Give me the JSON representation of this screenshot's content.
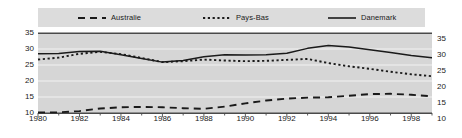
{
  "chart_data": {
    "type": "line",
    "title": "",
    "subtitle": "",
    "xlabel": "",
    "ylabel": "",
    "xlim": [
      1980,
      1999
    ],
    "ylim": [
      10,
      35
    ],
    "grid": true,
    "legend_position": "top",
    "x": [
      1980,
      1981,
      1982,
      1983,
      1984,
      1985,
      1986,
      1987,
      1988,
      1989,
      1990,
      1991,
      1992,
      1993,
      1994,
      1995,
      1996,
      1997,
      1998,
      1999
    ],
    "series": [
      {
        "name": "Australie",
        "style": "dashed",
        "color": "#1a1a1a",
        "values": [
          10.2,
          10.2,
          10.6,
          11.4,
          11.8,
          11.9,
          11.8,
          11.5,
          11.3,
          12.0,
          13.0,
          13.9,
          14.5,
          14.8,
          14.9,
          15.4,
          15.9,
          16.0,
          15.7,
          15.2
        ]
      },
      {
        "name": "Pays-Bas",
        "style": "dotted",
        "color": "#1a1a1a",
        "values": [
          26.7,
          27.3,
          28.5,
          29.1,
          28.4,
          27.2,
          25.9,
          26.2,
          26.7,
          26.4,
          26.2,
          26.3,
          26.6,
          26.9,
          25.6,
          24.6,
          23.8,
          22.9,
          22.1,
          21.5
        ]
      },
      {
        "name": "Danemark",
        "style": "solid",
        "color": "#1a1a1a",
        "values": [
          28.5,
          28.6,
          29.2,
          29.3,
          28.2,
          27.0,
          25.9,
          26.4,
          27.6,
          28.2,
          28.1,
          28.2,
          28.7,
          30.2,
          31.1,
          30.6,
          29.8,
          28.9,
          28.0,
          27.3
        ]
      }
    ],
    "y_ticks": [
      10,
      15,
      20,
      25,
      30,
      35
    ],
    "x_ticks": [
      1980,
      1982,
      1984,
      1986,
      1988,
      1990,
      1992,
      1994,
      1996,
      1998
    ],
    "x_minor_tick_interval": 1,
    "axis_left_labels": [
      "35",
      "30",
      "25",
      "20",
      "15",
      "10"
    ],
    "axis_right_labels": [
      "35",
      "30",
      "25",
      "20",
      "15",
      "10"
    ],
    "x_tick_labels": [
      "1980",
      "1982",
      "1984",
      "1986",
      "1988",
      "1990",
      "1992",
      "1994",
      "1996",
      "1998"
    ]
  },
  "legend": {
    "entries": [
      {
        "label": "Australie",
        "style": "dashed"
      },
      {
        "label": "Pays-Bas",
        "style": "dotted"
      },
      {
        "label": "Danemark",
        "style": "solid"
      }
    ]
  },
  "colors": {
    "plot_background": "#d6d6d6",
    "legend_background": "#dcdcdc",
    "gridline": "#f2f2f2",
    "axis": "#4a4a4a",
    "series": "#1a1a1a",
    "text": "#1a1a1a"
  }
}
